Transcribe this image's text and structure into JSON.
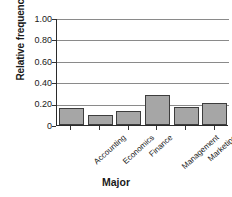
{
  "chart_data": {
    "type": "bar",
    "title": "",
    "xlabel": "Major",
    "ylabel": "Relative frequency",
    "categories": [
      "Accounting",
      "Economics",
      "Finance",
      "Management",
      "Marketing",
      "MIS"
    ],
    "values": [
      0.16,
      0.09,
      0.13,
      0.28,
      0.17,
      0.21
    ],
    "ylim": [
      0,
      1.0
    ],
    "ytick_labels": [
      "1.00",
      "0.80",
      "0.60",
      "0.40",
      "0.20",
      "0"
    ],
    "ytick_values": [
      1.0,
      0.8,
      0.6,
      0.4,
      0.2,
      0
    ],
    "grid": true,
    "legend": false,
    "bar_color": "#a6a6a6",
    "bar_edge_color": "#3d3d3d",
    "axis_color": "#2b2b2b",
    "grid_color": "#8a8a8a",
    "background": "#ffffff"
  }
}
